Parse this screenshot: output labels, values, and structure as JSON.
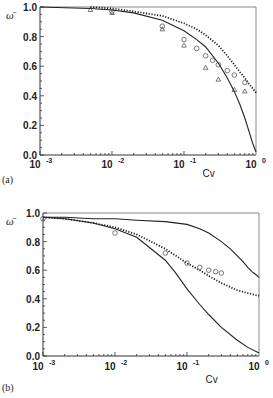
{
  "chart_data": [
    {
      "panel": "(a)",
      "type": "scatter",
      "title": "",
      "xlabel": "Cv",
      "ylabel": "ω̄",
      "xscale": "log",
      "xlim": [
        0.001,
        1
      ],
      "ylim": [
        0.0,
        1.0
      ],
      "xticks": [
        "10^-3",
        "10^-2",
        "10^-1",
        "10^0"
      ],
      "yticks": [
        "0.0",
        "0.2",
        "0.4",
        "0.6",
        "0.8",
        "1.0"
      ],
      "grid": false,
      "legend": "none",
      "series": [
        {
          "name": "solid curve",
          "style": "solid-line",
          "x": [
            0.001,
            0.005,
            0.01,
            0.02,
            0.05,
            0.1,
            0.15,
            0.2,
            0.3,
            0.4,
            0.5,
            0.6,
            0.7,
            0.8,
            0.9,
            1.0
          ],
          "y": [
            1.0,
            0.99,
            0.98,
            0.96,
            0.91,
            0.84,
            0.78,
            0.73,
            0.62,
            0.52,
            0.43,
            0.34,
            0.25,
            0.16,
            0.08,
            0.02
          ]
        },
        {
          "name": "dotted curve",
          "style": "dotted-line",
          "x": [
            0.005,
            0.01,
            0.02,
            0.05,
            0.1,
            0.15,
            0.2,
            0.3,
            0.4,
            0.5,
            0.6,
            0.7,
            0.8,
            0.9,
            1.0
          ],
          "y": [
            1.0,
            0.99,
            0.97,
            0.94,
            0.89,
            0.85,
            0.81,
            0.74,
            0.67,
            0.61,
            0.56,
            0.52,
            0.48,
            0.45,
            0.42
          ]
        },
        {
          "name": "circles",
          "style": "open-circle",
          "x": [
            0.01,
            0.05,
            0.1,
            0.15,
            0.2,
            0.25,
            0.3,
            0.4,
            0.5,
            0.7
          ],
          "y": [
            0.97,
            0.87,
            0.78,
            0.72,
            0.67,
            0.64,
            0.61,
            0.57,
            0.54,
            0.49
          ]
        },
        {
          "name": "triangles",
          "style": "open-triangle",
          "x": [
            0.005,
            0.01,
            0.05,
            0.1,
            0.2,
            0.3,
            0.5,
            0.7
          ],
          "y": [
            0.98,
            0.96,
            0.85,
            0.74,
            0.59,
            0.51,
            0.44,
            0.43
          ]
        }
      ]
    },
    {
      "panel": "(b)",
      "type": "scatter",
      "title": "",
      "xlabel": "Cv",
      "ylabel": "ω̄",
      "xscale": "log",
      "xlim": [
        0.001,
        1
      ],
      "ylim": [
        0.0,
        1.0
      ],
      "xticks": [
        "10^-3",
        "10^-2",
        "10^-1",
        "10^0"
      ],
      "yticks": [
        "0.0",
        "0.2",
        "0.4",
        "0.6",
        "0.8",
        "1.0"
      ],
      "grid": false,
      "legend": "none",
      "series": [
        {
          "name": "upper solid curve",
          "style": "solid-line",
          "x": [
            0.001,
            0.002,
            0.005,
            0.01,
            0.02,
            0.05,
            0.1,
            0.15,
            0.2,
            0.3,
            0.4,
            0.5,
            0.6,
            0.7,
            0.8,
            0.9,
            1.0
          ],
          "y": [
            0.97,
            0.97,
            0.96,
            0.96,
            0.95,
            0.94,
            0.92,
            0.89,
            0.86,
            0.8,
            0.75,
            0.7,
            0.66,
            0.62,
            0.59,
            0.57,
            0.55
          ]
        },
        {
          "name": "dotted curve",
          "style": "dotted-line",
          "x": [
            0.001,
            0.002,
            0.005,
            0.01,
            0.02,
            0.05,
            0.1,
            0.15,
            0.2,
            0.3,
            0.5,
            0.7,
            1.0
          ],
          "y": [
            0.97,
            0.96,
            0.93,
            0.9,
            0.85,
            0.75,
            0.65,
            0.6,
            0.56,
            0.51,
            0.46,
            0.44,
            0.42
          ]
        },
        {
          "name": "lower solid curve",
          "style": "solid-line",
          "x": [
            0.001,
            0.002,
            0.005,
            0.01,
            0.02,
            0.05,
            0.07,
            0.1,
            0.15,
            0.2,
            0.3,
            0.5,
            0.7,
            1.0
          ],
          "y": [
            0.97,
            0.96,
            0.93,
            0.89,
            0.83,
            0.67,
            0.58,
            0.47,
            0.36,
            0.29,
            0.2,
            0.11,
            0.06,
            0.02
          ]
        },
        {
          "name": "circles",
          "style": "open-circle",
          "x": [
            0.001,
            0.01,
            0.05,
            0.1,
            0.15,
            0.2,
            0.25,
            0.3
          ],
          "y": [
            0.96,
            0.86,
            0.72,
            0.65,
            0.62,
            0.6,
            0.59,
            0.58
          ]
        }
      ]
    }
  ],
  "panels": [
    {
      "label": "(a)",
      "ylabel": "ω̄",
      "xlabel": "Cv",
      "ytick_labels": [
        "0.0",
        "0.2",
        "0.4",
        "0.6",
        "0.8",
        "1.0"
      ],
      "xtick_labels": [
        {
          "base": "10",
          "exp": "-3"
        },
        {
          "base": "10",
          "exp": "-2"
        },
        {
          "base": "10",
          "exp": "-1"
        },
        {
          "base": "10",
          "exp": "0"
        }
      ]
    },
    {
      "label": "(b)",
      "ylabel": "ω̄",
      "xlabel": "Cv",
      "ytick_labels": [
        "0.0",
        "0.2",
        "0.4",
        "0.6",
        "0.8",
        "1.0"
      ],
      "xtick_labels": [
        {
          "base": "10",
          "exp": "-3"
        },
        {
          "base": "10",
          "exp": "-2"
        },
        {
          "base": "10",
          "exp": "-1"
        },
        {
          "base": "10",
          "exp": "0"
        }
      ]
    }
  ]
}
